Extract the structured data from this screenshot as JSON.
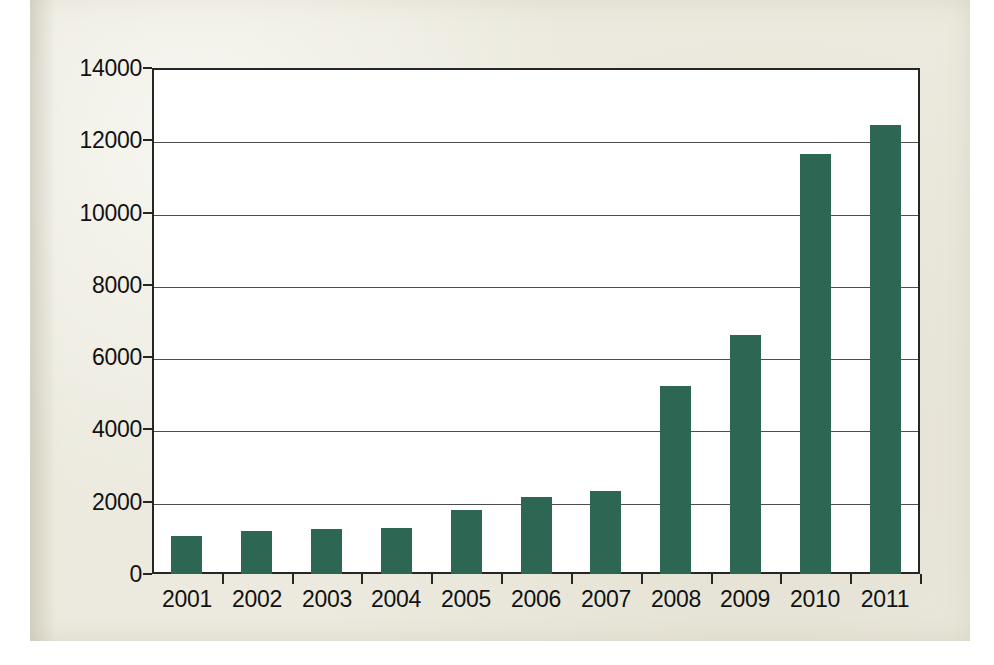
{
  "figure": {
    "page_background": "#eceade",
    "plot_background": "#ffffff",
    "axis_color": "#262626",
    "gridline_color": "#4d4d4d",
    "bar_color": "#2e6654"
  },
  "chart_data": {
    "type": "bar",
    "title": "",
    "subtitle": "",
    "xlabel": "",
    "ylabel": "",
    "categories": [
      "2001",
      "2002",
      "2003",
      "2004",
      "2005",
      "2006",
      "2007",
      "2008",
      "2009",
      "2010",
      "2011"
    ],
    "values": [
      1050,
      1180,
      1250,
      1260,
      1780,
      2120,
      2290,
      5200,
      6620,
      11620,
      12420
    ],
    "series": [
      {
        "name": "",
        "values": [
          1050,
          1180,
          1250,
          1260,
          1780,
          2120,
          2290,
          5200,
          6620,
          11620,
          12420
        ]
      }
    ],
    "ylim": [
      0,
      14000
    ],
    "ytick_values": [
      0,
      2000,
      4000,
      6000,
      8000,
      10000,
      12000,
      14000
    ],
    "ytick_labels": [
      "0",
      "2000",
      "4000",
      "6000",
      "8000",
      "10000",
      "12000",
      "14000"
    ],
    "xtick_labels": [
      "2001",
      "2002",
      "2003",
      "2004",
      "2005",
      "2006",
      "2007",
      "2008",
      "2009",
      "2010",
      "2011"
    ],
    "grid": true,
    "grid_axis": "y",
    "legend": false,
    "legend_position": "none",
    "annotations": [],
    "data_labels": false
  }
}
